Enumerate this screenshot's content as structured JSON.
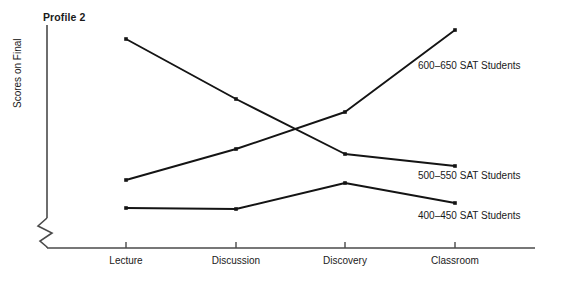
{
  "chart_data": {
    "type": "line",
    "title": "Profile 2",
    "xlabel": "",
    "ylabel": "Scores on Final",
    "grid": false,
    "legend_position": "right-inline",
    "axis_break": true,
    "categories": [
      "Lecture",
      "Discussion",
      "Discovery",
      "Classroom"
    ],
    "series": [
      {
        "name": "600–650 SAT Students",
        "values": [
          35,
          52,
          72,
          88
        ],
        "label_x": 418,
        "label_y": 60,
        "points": [
          {
            "x": 126,
            "y": 180
          },
          {
            "x": 236,
            "y": 149
          },
          {
            "x": 345,
            "y": 112
          },
          {
            "x": 455,
            "y": 30
          }
        ]
      },
      {
        "name": "500–550 SAT Students",
        "values": [
          88,
          70,
          50,
          43
        ],
        "label_x": 418,
        "label_y": 170,
        "points": [
          {
            "x": 126,
            "y": 39
          },
          {
            "x": 236,
            "y": 99
          },
          {
            "x": 345,
            "y": 154
          },
          {
            "x": 455,
            "y": 166
          }
        ]
      },
      {
        "name": "400–450 SAT Students",
        "values": [
          27,
          26,
          38,
          29
        ],
        "label_x": 418,
        "label_y": 210,
        "points": [
          {
            "x": 126,
            "y": 208
          },
          {
            "x": 236,
            "y": 209
          },
          {
            "x": 345,
            "y": 183
          },
          {
            "x": 455,
            "y": 203
          }
        ]
      }
    ],
    "axes": {
      "x_axis_y": 248,
      "x_axis_start": 47,
      "x_axis_end": 535,
      "y_axis_x": 47,
      "y_axis_top": 25,
      "y_axis_bottom": 218,
      "tick_positions": [
        126,
        236,
        345,
        455
      ],
      "tick_length": 6
    },
    "line_color": "#141414",
    "axis_color": "#4a4a4a",
    "background": "#ffffff"
  }
}
